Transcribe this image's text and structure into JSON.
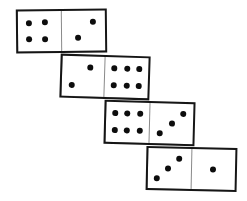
{
  "scene": {
    "description": "Hand-drawn domino sequence puzzle",
    "background_color": "#ffffff",
    "ink_color": "#161616",
    "pip_color": "#0d0d0d",
    "divider_color": "#8a8a8a"
  },
  "dominoes": [
    {
      "name": "domino-1",
      "left_value": 4,
      "right_value": 2,
      "label": "4|2",
      "x": 16,
      "y": 9,
      "width": 91,
      "height": 44,
      "rotation": -0.6,
      "left_pips": [
        {
          "x": 27,
          "y": 30
        },
        {
          "x": 63,
          "y": 28
        },
        {
          "x": 27,
          "y": 70
        },
        {
          "x": 63,
          "y": 70
        }
      ],
      "right_pips": [
        {
          "x": 72,
          "y": 28
        },
        {
          "x": 38,
          "y": 68
        }
      ]
    },
    {
      "name": "domino-2",
      "left_value": 2,
      "right_value": 6,
      "label": "2|6",
      "x": 60,
      "y": 55,
      "width": 90,
      "height": 44,
      "rotation": 1.8,
      "left_pips": [
        {
          "x": 66,
          "y": 28
        },
        {
          "x": 24,
          "y": 72
        }
      ],
      "right_pips": [
        {
          "x": 20,
          "y": 28
        },
        {
          "x": 50,
          "y": 28
        },
        {
          "x": 80,
          "y": 28
        },
        {
          "x": 20,
          "y": 70
        },
        {
          "x": 50,
          "y": 70
        },
        {
          "x": 80,
          "y": 70
        }
      ]
    },
    {
      "name": "domino-3",
      "left_value": 6,
      "right_value": 3,
      "label": "6|3",
      "x": 104,
      "y": 101,
      "width": 91,
      "height": 44,
      "rotation": 1.5,
      "left_pips": [
        {
          "x": 20,
          "y": 28
        },
        {
          "x": 50,
          "y": 28
        },
        {
          "x": 80,
          "y": 28
        },
        {
          "x": 20,
          "y": 70
        },
        {
          "x": 50,
          "y": 70
        },
        {
          "x": 80,
          "y": 70
        }
      ],
      "right_pips": [
        {
          "x": 78,
          "y": 24
        },
        {
          "x": 52,
          "y": 50
        },
        {
          "x": 24,
          "y": 76
        }
      ]
    },
    {
      "name": "domino-4",
      "left_value": 3,
      "right_value": 1,
      "label": "3|1",
      "x": 146,
      "y": 147,
      "width": 91,
      "height": 44,
      "rotation": 1.2,
      "left_pips": [
        {
          "x": 72,
          "y": 24
        },
        {
          "x": 46,
          "y": 50
        },
        {
          "x": 20,
          "y": 76
        }
      ],
      "right_pips": [
        {
          "x": 50,
          "y": 50
        }
      ]
    }
  ]
}
